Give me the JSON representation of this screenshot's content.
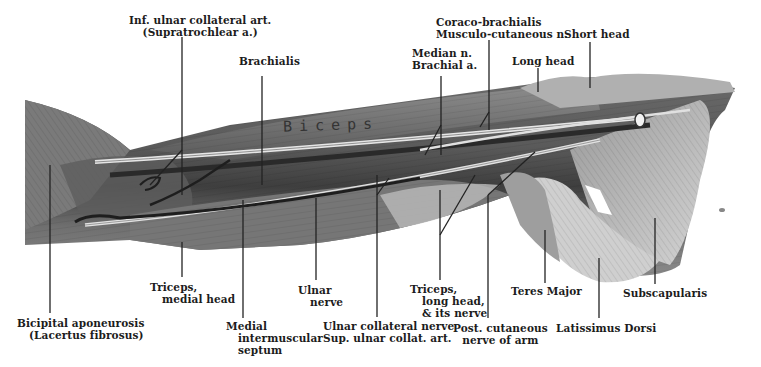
{
  "figure": {
    "muscle_inscription": "Biceps",
    "colors": {
      "background": "#ffffff",
      "muscle_dark": "#4a4a4a",
      "muscle_mid": "#8a8a8a",
      "muscle_light": "#c8c8c8",
      "nerve": "#e8e8e8",
      "leader_line": "#222222"
    }
  },
  "labels": {
    "top": [
      {
        "id": "inf-ulnar-collateral",
        "lines": [
          "Inf. ulnar collateral art.",
          "(Supratrochlear a.)"
        ]
      },
      {
        "id": "brachialis",
        "lines": [
          "Brachialis"
        ]
      },
      {
        "id": "median-brachial",
        "lines": [
          "Median n.",
          "Brachial a."
        ]
      },
      {
        "id": "coraco-musculo",
        "lines": [
          "Coraco-brachialis",
          "Musculo-cutaneous n."
        ]
      },
      {
        "id": "long-head",
        "lines": [
          "Long head"
        ]
      },
      {
        "id": "short-head",
        "lines": [
          "Short head"
        ]
      }
    ],
    "bottom": [
      {
        "id": "bicipital-aponeurosis",
        "lines": [
          "Bicipital aponeurosis",
          "(Lacertus fibrosus)"
        ]
      },
      {
        "id": "triceps-medial",
        "lines": [
          "Triceps,",
          "medial head"
        ]
      },
      {
        "id": "medial-septum",
        "lines": [
          "Medial",
          "intermuscular",
          "septum"
        ]
      },
      {
        "id": "ulnar-nerve",
        "lines": [
          "Ulnar",
          "nerve"
        ]
      },
      {
        "id": "ulnar-collateral-nerve",
        "lines": [
          "Ulnar collateral nerve",
          "Sup. ulnar collat. art."
        ]
      },
      {
        "id": "triceps-long",
        "lines": [
          "Triceps,",
          "long head,",
          "& its nerve"
        ]
      },
      {
        "id": "post-cutaneous",
        "lines": [
          "Post. cutaneous",
          "nerve of arm"
        ]
      },
      {
        "id": "teres-major",
        "lines": [
          "Teres Major"
        ]
      },
      {
        "id": "latissimus-dorsi",
        "lines": [
          "Latissimus Dorsi"
        ]
      },
      {
        "id": "subscapularis",
        "lines": [
          "Subscapularis"
        ]
      }
    ]
  }
}
